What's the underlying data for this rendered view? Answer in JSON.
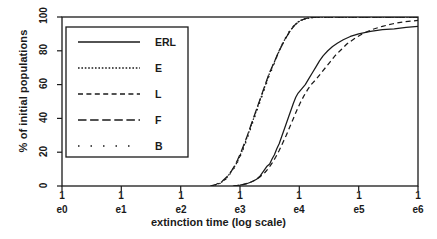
{
  "chart_data": {
    "type": "line",
    "title": "",
    "xlabel": "extinction time (log scale)",
    "ylabel": "% of initial populations",
    "xtick_labels": [
      "1e0",
      "1e1",
      "1e2",
      "1e3",
      "1e4",
      "1e5",
      "1e6"
    ],
    "xtick_line1": [
      "1",
      "1",
      "1",
      "1",
      "1",
      "1",
      "1"
    ],
    "xtick_line2": [
      "e0",
      "e1",
      "e2",
      "e3",
      "e4",
      "e5",
      "e6"
    ],
    "ytick_labels": [
      "0",
      "20",
      "40",
      "60",
      "80",
      "100"
    ],
    "ylim": [
      0,
      100
    ],
    "xlim_exp": [
      0,
      6
    ],
    "grid": false,
    "legend_position": "upper-left-inset",
    "legend_entries": [
      {
        "label": "ERL",
        "style": "solid"
      },
      {
        "label": "E",
        "style": "dotted"
      },
      {
        "label": "L",
        "style": "dashed"
      },
      {
        "label": "F",
        "style": "longdash"
      },
      {
        "label": "B",
        "style": "sparsedot"
      }
    ],
    "series": [
      {
        "name": "ERL",
        "style": "solid",
        "points_exp_pct": [
          [
            2.88,
            0
          ],
          [
            3.0,
            0.5
          ],
          [
            3.1,
            1.2
          ],
          [
            3.2,
            2.5
          ],
          [
            3.28,
            4.0
          ],
          [
            3.34,
            6.0
          ],
          [
            3.4,
            9.0
          ],
          [
            3.45,
            11.5
          ],
          [
            3.5,
            13.0
          ],
          [
            3.54,
            16.0
          ],
          [
            3.58,
            18.5
          ],
          [
            3.62,
            22.0
          ],
          [
            3.66,
            25.0
          ],
          [
            3.7,
            29.0
          ],
          [
            3.74,
            33.0
          ],
          [
            3.78,
            37.0
          ],
          [
            3.82,
            41.0
          ],
          [
            3.86,
            45.0
          ],
          [
            3.9,
            49.0
          ],
          [
            3.94,
            52.5
          ],
          [
            3.98,
            55.0
          ],
          [
            4.04,
            57.5
          ],
          [
            4.1,
            60.0
          ],
          [
            4.16,
            63.5
          ],
          [
            4.22,
            67.0
          ],
          [
            4.28,
            70.5
          ],
          [
            4.34,
            74.0
          ],
          [
            4.4,
            77.0
          ],
          [
            4.48,
            80.0
          ],
          [
            4.56,
            82.5
          ],
          [
            4.64,
            84.5
          ],
          [
            4.74,
            86.5
          ],
          [
            4.86,
            88.5
          ],
          [
            5.0,
            90.0
          ],
          [
            5.2,
            91.5
          ],
          [
            5.4,
            92.5
          ],
          [
            5.6,
            93.0
          ],
          [
            5.8,
            93.8
          ],
          [
            6.0,
            94.5
          ]
        ]
      },
      {
        "name": "E",
        "style": "dotted",
        "points_exp_pct": [
          [
            2.52,
            0
          ],
          [
            2.62,
            1.0
          ],
          [
            2.7,
            2.5
          ],
          [
            2.78,
            5.0
          ],
          [
            2.84,
            8.0
          ],
          [
            2.9,
            11.0
          ],
          [
            2.95,
            14.0
          ],
          [
            3.0,
            18.0
          ],
          [
            3.05,
            22.0
          ],
          [
            3.1,
            27.0
          ],
          [
            3.14,
            31.0
          ],
          [
            3.18,
            35.0
          ],
          [
            3.22,
            39.0
          ],
          [
            3.26,
            43.0
          ],
          [
            3.3,
            47.0
          ],
          [
            3.34,
            51.0
          ],
          [
            3.38,
            55.0
          ],
          [
            3.42,
            59.0
          ],
          [
            3.46,
            63.0
          ],
          [
            3.5,
            67.0
          ],
          [
            3.55,
            71.0
          ],
          [
            3.6,
            75.0
          ],
          [
            3.65,
            79.0
          ],
          [
            3.7,
            83.0
          ],
          [
            3.76,
            87.0
          ],
          [
            3.83,
            91.0
          ],
          [
            3.9,
            94.5
          ],
          [
            3.98,
            97.0
          ],
          [
            4.08,
            98.8
          ],
          [
            4.2,
            99.6
          ],
          [
            4.4,
            100
          ],
          [
            6.0,
            100
          ]
        ]
      },
      {
        "name": "L",
        "style": "dashed",
        "points_exp_pct": [
          [
            2.9,
            0
          ],
          [
            3.05,
            0.8
          ],
          [
            3.16,
            2.0
          ],
          [
            3.26,
            3.5
          ],
          [
            3.34,
            5.5
          ],
          [
            3.42,
            8.0
          ],
          [
            3.48,
            10.5
          ],
          [
            3.54,
            13.5
          ],
          [
            3.6,
            17.0
          ],
          [
            3.66,
            21.0
          ],
          [
            3.72,
            25.5
          ],
          [
            3.78,
            30.0
          ],
          [
            3.84,
            35.0
          ],
          [
            3.9,
            40.0
          ],
          [
            3.96,
            45.0
          ],
          [
            4.02,
            49.5
          ],
          [
            4.08,
            53.5
          ],
          [
            4.14,
            57.0
          ],
          [
            4.2,
            60.0
          ],
          [
            4.28,
            63.0
          ],
          [
            4.36,
            66.5
          ],
          [
            4.44,
            70.0
          ],
          [
            4.52,
            73.5
          ],
          [
            4.6,
            77.0
          ],
          [
            4.7,
            80.5
          ],
          [
            4.8,
            84.0
          ],
          [
            4.92,
            87.0
          ],
          [
            5.06,
            90.0
          ],
          [
            5.22,
            92.5
          ],
          [
            5.4,
            94.5
          ],
          [
            5.58,
            96.0
          ],
          [
            5.76,
            97.2
          ],
          [
            6.0,
            98.0
          ]
        ]
      },
      {
        "name": "F",
        "style": "longdash",
        "points_exp_pct": [
          [
            2.5,
            0
          ],
          [
            2.6,
            1.0
          ],
          [
            2.7,
            2.8
          ],
          [
            2.78,
            5.5
          ],
          [
            2.85,
            8.5
          ],
          [
            2.91,
            12.0
          ],
          [
            2.96,
            15.5
          ],
          [
            3.01,
            19.5
          ],
          [
            3.06,
            24.0
          ],
          [
            3.11,
            28.5
          ],
          [
            3.15,
            32.5
          ],
          [
            3.19,
            36.5
          ],
          [
            3.23,
            40.5
          ],
          [
            3.27,
            44.5
          ],
          [
            3.31,
            48.5
          ],
          [
            3.35,
            52.5
          ],
          [
            3.39,
            56.5
          ],
          [
            3.43,
            60.5
          ],
          [
            3.47,
            64.5
          ],
          [
            3.51,
            68.0
          ],
          [
            3.56,
            72.0
          ],
          [
            3.61,
            76.0
          ],
          [
            3.66,
            80.0
          ],
          [
            3.72,
            84.0
          ],
          [
            3.78,
            88.0
          ],
          [
            3.85,
            92.0
          ],
          [
            3.93,
            95.5
          ],
          [
            4.02,
            98.0
          ],
          [
            4.14,
            99.4
          ],
          [
            4.3,
            100
          ],
          [
            6.0,
            100
          ]
        ]
      },
      {
        "name": "B",
        "style": "sparsedot",
        "points_exp_pct": [
          [
            2.54,
            0
          ],
          [
            2.66,
            1.5
          ],
          [
            2.76,
            4.0
          ],
          [
            2.84,
            7.5
          ],
          [
            2.92,
            11.5
          ],
          [
            2.98,
            15.5
          ],
          [
            3.04,
            20.5
          ],
          [
            3.09,
            25.0
          ],
          [
            3.14,
            30.0
          ],
          [
            3.19,
            35.0
          ],
          [
            3.24,
            40.0
          ],
          [
            3.29,
            45.0
          ],
          [
            3.34,
            50.0
          ],
          [
            3.39,
            55.0
          ],
          [
            3.44,
            60.0
          ],
          [
            3.49,
            65.0
          ],
          [
            3.55,
            70.0
          ],
          [
            3.61,
            75.5
          ],
          [
            3.67,
            81.0
          ],
          [
            3.74,
            86.0
          ],
          [
            3.82,
            91.0
          ],
          [
            3.91,
            95.0
          ],
          [
            4.01,
            98.0
          ],
          [
            4.14,
            99.5
          ],
          [
            4.32,
            100
          ],
          [
            6.0,
            100
          ]
        ]
      }
    ]
  }
}
